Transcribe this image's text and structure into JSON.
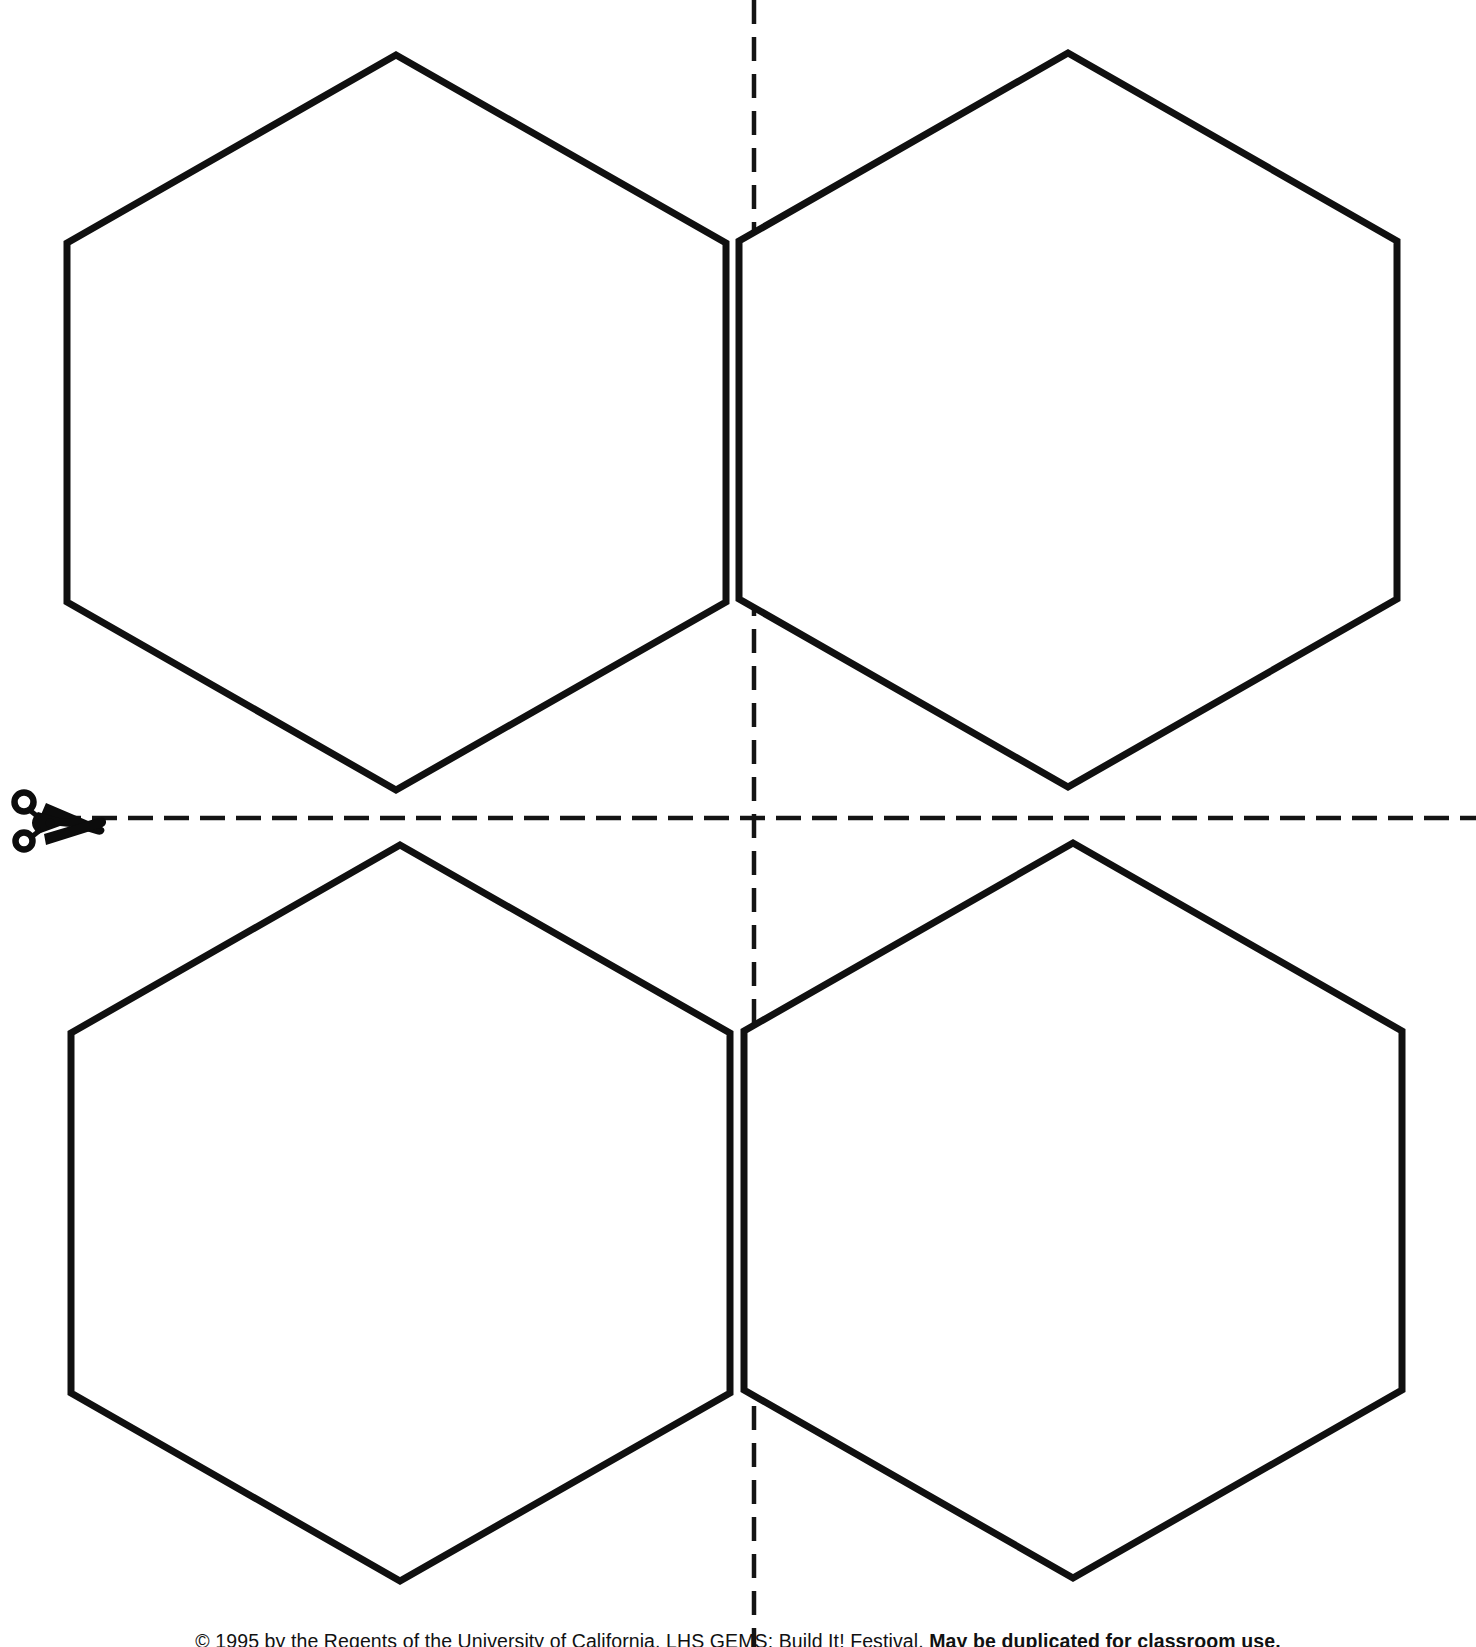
{
  "page": {
    "background_color": "#ffffff",
    "ink_color": "#101010",
    "width": 1476,
    "height": 1647
  },
  "shapes": {
    "type": "hexagon",
    "count": 4,
    "sides": 6,
    "orientation": "pointy-top",
    "stroke_color": "#101010",
    "stroke_width": 7,
    "fill_color": "#ffffff",
    "items": [
      {
        "name": "hexagon-top-left",
        "label": "Hexagon 1",
        "quadrant": "top-left",
        "center_x": 396,
        "center_y": 422,
        "width": 659,
        "height": 735,
        "points": "396,55 726,243 726,602 396,790 67,602 67,243"
      },
      {
        "name": "hexagon-top-right",
        "label": "Hexagon 2",
        "quadrant": "top-right",
        "center_x": 1068,
        "center_y": 420,
        "width": 658,
        "height": 733,
        "points": "1068,53 1397,241 1397,599 1068,787 739,599 739,241"
      },
      {
        "name": "hexagon-bottom-left",
        "label": "Hexagon 3",
        "quadrant": "bottom-left",
        "center_x": 400,
        "center_y": 1213,
        "width": 659,
        "height": 737,
        "points": "400,845 730,1033 730,1393 400,1581 71,1393 71,1033"
      },
      {
        "name": "hexagon-bottom-right",
        "label": "Hexagon 4",
        "quadrant": "bottom-right",
        "center_x": 1073,
        "center_y": 1211,
        "width": 658,
        "height": 735,
        "points": "1073,843 1402,1031 1402,1390 1073,1578 744,1390 744,1031"
      }
    ]
  },
  "guides": {
    "horizontal_cut_line": {
      "name": "horizontal-cut-guide",
      "label": "Horizontal cut line",
      "style": "dashed",
      "y": 818,
      "x_start": 56,
      "x_end": 1476,
      "dash": "25 11"
    },
    "vertical_cut_line": {
      "name": "vertical-cut-guide",
      "label": "Vertical cut line",
      "style": "dashed",
      "x": 754,
      "y_start": 0,
      "y_end": 1647,
      "dash": "24 13"
    }
  },
  "icons": {
    "scissors": {
      "name": "scissors-icon",
      "label": "Cut here",
      "x": 14,
      "y": 788,
      "width": 92,
      "height": 58
    }
  },
  "footer": {
    "name": "copyright-credit",
    "regular_text": "© 1995 by the Regents of the University of California.  LHS GEMS: Build It! Festival.",
    "bold_text": "May be duplicated for classroom use.",
    "full_text": "© 1995 by the Regents of the University of California.  LHS GEMS: Build It! Festival. May be duplicated for classroom use."
  }
}
